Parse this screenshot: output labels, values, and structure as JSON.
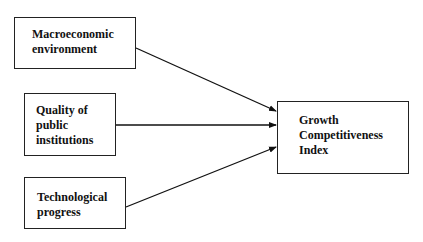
{
  "diagram": {
    "type": "flow",
    "inputs": [
      {
        "id": "macro",
        "label_lines": [
          "Macroeconomic",
          "environment"
        ]
      },
      {
        "id": "quality",
        "label_lines": [
          "Quality of",
          "public",
          "institutions"
        ]
      },
      {
        "id": "tech",
        "label_lines": [
          "Technological",
          "progress"
        ]
      }
    ],
    "output": {
      "id": "gci",
      "label_lines": [
        "Growth",
        "Competitiveness",
        "Index"
      ]
    },
    "edges": [
      {
        "from": "macro",
        "to": "gci"
      },
      {
        "from": "quality",
        "to": "gci"
      },
      {
        "from": "tech",
        "to": "gci"
      }
    ],
    "colors": {
      "line": "#111111",
      "box_border": "#222222",
      "background": "#ffffff"
    }
  }
}
